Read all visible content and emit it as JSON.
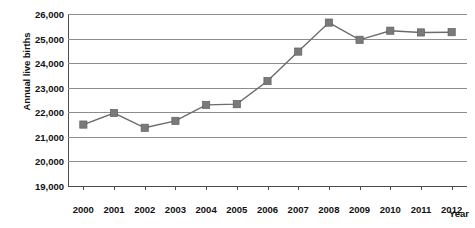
{
  "chart_data": {
    "type": "line",
    "title": "",
    "xlabel": "Year",
    "ylabel": "Annual live births",
    "categories": [
      "2000",
      "2001",
      "2002",
      "2003",
      "2004",
      "2005",
      "2006",
      "2007",
      "2008",
      "2009",
      "2010",
      "2011",
      "2012"
    ],
    "values": [
      21500,
      21970,
      21370,
      21650,
      22300,
      22330,
      23270,
      24470,
      25650,
      24950,
      25320,
      25250,
      25260
    ],
    "ylim": [
      19000,
      26000
    ],
    "ytick_labels": [
      "26,000",
      "25,000",
      "24,000",
      "23,000",
      "22,000",
      "21,000",
      "20,000",
      "19,000"
    ],
    "ytick_values": [
      26000,
      25000,
      24000,
      23000,
      22000,
      21000,
      20000,
      19000
    ],
    "grid": true,
    "legend": "none",
    "series_color": "#7a7a7a",
    "gridline_color": "#8c8c8c",
    "axis_color": "#4d4d4d",
    "marker_shape": "square"
  }
}
